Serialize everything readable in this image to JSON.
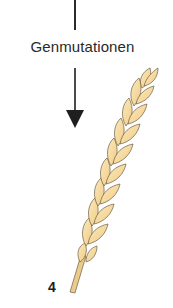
{
  "diagram": {
    "label": "Genmutationen",
    "stage_number": "4",
    "arrow": {
      "direction": "down",
      "color": "#1f1f1f"
    },
    "illustration": {
      "subject": "wheat-ear-icon",
      "fill_color": "#F4D593",
      "highlight_color": "#FBE9C0",
      "outline_color": "#6E5E45",
      "stem_color": "#EBCB8A"
    }
  }
}
